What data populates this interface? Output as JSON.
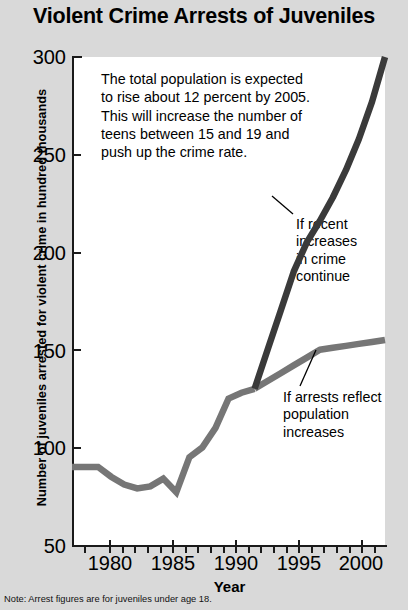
{
  "title": "Violent Crime Arrests of Juveniles",
  "footnote": "Note: Arrest figures are for juveniles under age 18.",
  "axes": {
    "ylabel": "Number of juveniles arrested for violent crime in hundred thousands",
    "xlabel": "Year",
    "yticks": [
      "300",
      "250",
      "200",
      "150",
      "100",
      "50"
    ],
    "xticks": [
      "1980",
      "1985",
      "1990",
      "1995",
      "2000"
    ]
  },
  "annotation": {
    "lines": [
      "The total population is expected",
      "to rise about 12 percent by 2005.",
      "This will increase the number of",
      "teens between 15 and 19 and",
      "push up the crime rate."
    ],
    "text": "The total population is expected to rise about 12 percent by 2005. This will increase the number of teens between 15 and 19 and push up the crime rate."
  },
  "series_labels": {
    "crime": [
      "If recent",
      "increases",
      "in crime",
      "continue"
    ],
    "population": [
      "If arrests reflect",
      "population",
      "increases"
    ]
  },
  "colors": {
    "background": "#d9d9d9",
    "plot_background": "#ffffff",
    "axis": "#1a1a1a",
    "series_crime": "#3a3a3a",
    "series_population": "#767676",
    "text": "#000000"
  },
  "chart_data": {
    "type": "line",
    "title": "Violent Crime Arrests of Juveniles",
    "xlabel": "Year",
    "ylabel": "Number of juveniles arrested for violent crime in hundred thousands",
    "xlim": [
      1978,
      2002
    ],
    "ylim": [
      50,
      300
    ],
    "yticks": [
      50,
      100,
      150,
      200,
      250,
      300
    ],
    "xticks": [
      1980,
      1985,
      1990,
      1995,
      2000
    ],
    "grid": false,
    "legend": "annotated-inline",
    "note": "Actual history 1978-1992 is a single shared line; from 1992 the chart splits into two projections.",
    "series": [
      {
        "name": "Historical (actual arrests)",
        "label": "",
        "color": "#767676",
        "x": [
          1978,
          1979,
          1980,
          1981,
          1982,
          1983,
          1984,
          1985,
          1986,
          1987,
          1988,
          1989,
          1990,
          1991,
          1992
        ],
        "values": [
          90,
          90,
          90,
          85,
          81,
          79,
          80,
          84,
          77,
          95,
          100,
          110,
          125,
          128,
          130
        ]
      },
      {
        "name": "If recent increases in crime continue",
        "label": "If recent increases in crime continue",
        "color": "#3a3a3a",
        "x": [
          1992,
          1993,
          1994,
          1995,
          1996,
          1997,
          1998,
          1999,
          2000,
          2001,
          2002
        ],
        "values": [
          130,
          150,
          170,
          190,
          205,
          216,
          228,
          242,
          258,
          277,
          300
        ]
      },
      {
        "name": "If arrests reflect population increases",
        "label": "If arrests reflect population increases",
        "color": "#767676",
        "x": [
          1992,
          1993,
          1994,
          1995,
          1996,
          1997,
          1998,
          1999,
          2000,
          2001,
          2002
        ],
        "values": [
          130,
          134,
          138,
          142,
          146,
          150,
          151,
          152,
          153,
          154,
          155
        ]
      }
    ]
  }
}
